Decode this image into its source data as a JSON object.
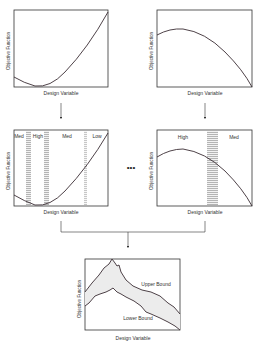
{
  "diagram": {
    "colors": {
      "line": "#333333",
      "curve": "#3a2d33",
      "band_fill": "#eeeeee",
      "stripe": "#9a9a9a",
      "bounds_fill": "#ececec"
    },
    "panels": [
      {
        "id": "top-left",
        "xlabel": "Design Variable",
        "ylabel": "Objective Function",
        "curve": "convex"
      },
      {
        "id": "top-right",
        "xlabel": "Design Variable",
        "ylabel": "Objective Function",
        "curve": "concave"
      },
      {
        "id": "mid-left",
        "xlabel": "Design Variable",
        "ylabel": "Objective Function",
        "regions": [
          "Med",
          "High",
          "Med",
          "Low"
        ]
      },
      {
        "id": "mid-right",
        "xlabel": "Design Variable",
        "ylabel": "Objective Function",
        "regions": [
          "High",
          "Med"
        ]
      },
      {
        "id": "bottom",
        "xlabel": "Design Variable",
        "ylabel": "Objective Function",
        "upper_label": "Upper Bound",
        "lower_label": "Lower Bound"
      }
    ],
    "ellipsis": "•••"
  }
}
